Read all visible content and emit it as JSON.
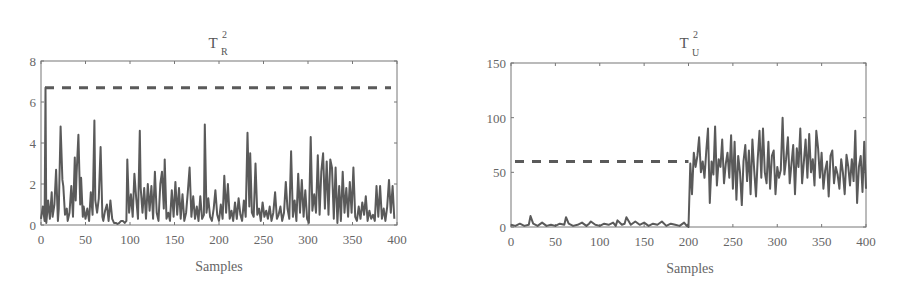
{
  "chart_data": [
    {
      "type": "line",
      "title": "T_R^2",
      "title_base": "T",
      "title_sup": "2",
      "title_sub": "R",
      "xlabel": "Samples",
      "ylabel": "",
      "xlim": [
        0,
        400
      ],
      "ylim": [
        0,
        8
      ],
      "xticks": [
        0,
        50,
        100,
        150,
        200,
        250,
        300,
        350,
        400
      ],
      "yticks": [
        0,
        2,
        4,
        6,
        8
      ],
      "grid": false,
      "threshold": {
        "name": "control limit",
        "style": "dashed",
        "value": 6.7
      },
      "series": [
        {
          "name": "T_R^2 statistic",
          "style": "solid",
          "x": [
            0,
            2,
            4,
            5,
            6,
            7,
            8,
            10,
            12,
            13,
            15,
            17,
            19,
            20,
            22,
            24,
            25,
            27,
            29,
            30,
            32,
            34,
            36,
            38,
            39,
            40,
            42,
            44,
            45,
            47,
            48,
            50,
            52,
            54,
            56,
            58,
            60,
            61,
            63,
            65,
            67,
            69,
            70,
            72,
            74,
            76,
            78,
            80,
            82,
            84,
            86,
            88,
            90,
            92,
            94,
            96,
            97,
            99,
            101,
            103,
            105,
            107,
            109,
            111,
            112,
            114,
            116,
            118,
            120,
            122,
            124,
            126,
            128,
            130,
            132,
            134,
            136,
            138,
            139,
            141,
            143,
            145,
            147,
            149,
            151,
            153,
            155,
            157,
            159,
            161,
            163,
            165,
            167,
            169,
            171,
            173,
            175,
            177,
            179,
            181,
            183,
            184,
            186,
            188,
            190,
            192,
            194,
            196,
            198,
            200,
            202,
            204,
            206,
            208,
            210,
            212,
            214,
            216,
            218,
            220,
            222,
            224,
            226,
            228,
            230,
            232,
            234,
            235,
            237,
            239,
            241,
            243,
            245,
            247,
            249,
            251,
            253,
            255,
            257,
            259,
            261,
            263,
            265,
            267,
            269,
            271,
            273,
            275,
            277,
            279,
            281,
            283,
            285,
            287,
            289,
            291,
            293,
            295,
            297,
            299,
            301,
            303,
            305,
            307,
            309,
            311,
            313,
            315,
            317,
            319,
            321,
            323,
            325,
            327,
            329,
            331,
            333,
            335,
            337,
            339,
            341,
            343,
            345,
            347,
            349,
            351,
            353,
            355,
            357,
            359,
            361,
            363,
            365,
            367,
            369,
            371,
            373,
            375,
            377,
            379,
            381,
            383,
            385,
            387,
            389,
            391,
            393,
            395,
            397,
            399,
            400
          ],
          "y": [
            0.3,
            0.9,
            0.2,
            6.7,
            0.1,
            0.6,
            1.2,
            0.3,
            1.6,
            0.4,
            1.0,
            2.7,
            0.2,
            0.8,
            4.8,
            2.2,
            1.9,
            0.5,
            0.8,
            0.2,
            0.6,
            1.9,
            0.4,
            3.3,
            1.2,
            2.5,
            4.4,
            1.0,
            2.3,
            0.4,
            0.9,
            0.3,
            0.8,
            0.2,
            1.6,
            0.5,
            5.1,
            1.2,
            0.6,
            1.3,
            3.8,
            0.4,
            0.2,
            0.7,
            1.0,
            0.2,
            1.2,
            0.3,
            0.1,
            0.1,
            0.05,
            0.1,
            0.2,
            0.2,
            0.1,
            0.2,
            3.2,
            0.6,
            1.5,
            0.4,
            2.5,
            1.3,
            0.3,
            4.6,
            1.8,
            0.6,
            1.8,
            0.3,
            2.0,
            0.7,
            1.9,
            0.3,
            2.6,
            0.6,
            0.2,
            2.0,
            2.6,
            0.8,
            3.2,
            0.3,
            0.6,
            0.2,
            1.7,
            0.4,
            2.1,
            0.5,
            1.8,
            0.3,
            1.5,
            0.2,
            0.6,
            1.6,
            2.8,
            0.4,
            1.4,
            0.3,
            0.9,
            0.2,
            1.4,
            0.3,
            0.5,
            4.9,
            0.6,
            1.3,
            0.4,
            0.2,
            0.8,
            1.7,
            0.5,
            0.2,
            1.0,
            0.3,
            2.4,
            0.6,
            2.0,
            0.3,
            0.7,
            0.2,
            1.1,
            0.3,
            1.3,
            0.5,
            0.2,
            1.2,
            0.4,
            4.5,
            0.9,
            3.5,
            0.6,
            0.4,
            3.0,
            0.5,
            0.8,
            0.2,
            1.1,
            0.4,
            0.7,
            0.3,
            0.9,
            0.2,
            0.6,
            1.6,
            0.3,
            0.5,
            0.9,
            0.2,
            0.6,
            2.1,
            0.8,
            0.3,
            3.6,
            0.4,
            1.2,
            0.2,
            2.5,
            0.6,
            2.2,
            0.4,
            1.7,
            0.3,
            0.1,
            4.3,
            0.7,
            1.5,
            0.6,
            3.4,
            0.5,
            2.6,
            3.5,
            0.8,
            3.1,
            0.5,
            3.2,
            2.8,
            0.3,
            2.8,
            0.1,
            1.9,
            0.2,
            2.6,
            0.6,
            1.8,
            0.4,
            2.1,
            0.6,
            2.8,
            0.4,
            0.2,
            0.9,
            0.3,
            1.1,
            0.5,
            1.4,
            0.2,
            0.7,
            0.3,
            0.5,
            0.2,
            1.9,
            0.4,
            1.9,
            0.3,
            0.8,
            0.2,
            0.9,
            2.2,
            0.6,
            1.9,
            0.3
          ]
        }
      ]
    },
    {
      "type": "line",
      "title": "T_U^2",
      "title_base": "T",
      "title_sup": "2",
      "title_sub": "U",
      "xlabel": "Samples",
      "ylabel": "",
      "xlim": [
        0,
        400
      ],
      "ylim": [
        0,
        150
      ],
      "xticks": [
        0,
        50,
        100,
        150,
        200,
        250,
        300,
        350,
        400
      ],
      "yticks": [
        0,
        50,
        100,
        150
      ],
      "grid": false,
      "threshold": {
        "name": "control limit",
        "style": "dashed",
        "value": 60
      },
      "series": [
        {
          "name": "T_U^2 statistic",
          "style": "solid",
          "x": [
            0,
            5,
            10,
            15,
            20,
            22,
            25,
            30,
            35,
            40,
            45,
            50,
            55,
            60,
            62,
            65,
            70,
            75,
            80,
            85,
            88,
            90,
            95,
            100,
            105,
            110,
            115,
            118,
            120,
            125,
            128,
            130,
            135,
            140,
            145,
            150,
            155,
            160,
            165,
            170,
            175,
            180,
            185,
            190,
            195,
            198,
            199,
            200,
            202,
            204,
            206,
            208,
            210,
            212,
            214,
            216,
            218,
            220,
            222,
            224,
            226,
            228,
            230,
            232,
            234,
            236,
            238,
            240,
            242,
            244,
            246,
            248,
            250,
            252,
            254,
            256,
            258,
            260,
            262,
            264,
            266,
            268,
            270,
            272,
            274,
            276,
            278,
            280,
            282,
            284,
            286,
            288,
            290,
            292,
            294,
            296,
            298,
            300,
            302,
            304,
            306,
            308,
            310,
            312,
            314,
            316,
            318,
            320,
            322,
            324,
            326,
            328,
            330,
            332,
            334,
            336,
            338,
            340,
            342,
            344,
            346,
            348,
            350,
            352,
            354,
            356,
            358,
            360,
            362,
            364,
            366,
            368,
            370,
            372,
            374,
            376,
            378,
            380,
            382,
            384,
            386,
            388,
            390,
            392,
            394,
            396,
            398,
            400
          ],
          "y": [
            2,
            1,
            3,
            1,
            2,
            10,
            3,
            1,
            4,
            1,
            2,
            1,
            3,
            2,
            9,
            3,
            1,
            2,
            4,
            1,
            3,
            5,
            2,
            1,
            3,
            2,
            4,
            1,
            6,
            2,
            3,
            9,
            2,
            5,
            2,
            4,
            1,
            3,
            2,
            5,
            1,
            3,
            2,
            1,
            4,
            1,
            2,
            0,
            58,
            30,
            68,
            55,
            65,
            82,
            50,
            60,
            45,
            70,
            90,
            22,
            60,
            48,
            92,
            38,
            62,
            55,
            80,
            40,
            58,
            68,
            45,
            84,
            35,
            78,
            25,
            65,
            50,
            20,
            60,
            75,
            42,
            70,
            30,
            80,
            52,
            28,
            62,
            88,
            45,
            90,
            50,
            40,
            78,
            35,
            65,
            70,
            30,
            55,
            45,
            52,
            100,
            48,
            62,
            82,
            40,
            58,
            75,
            30,
            72,
            55,
            90,
            40,
            60,
            80,
            45,
            85,
            50,
            62,
            38,
            88,
            72,
            45,
            68,
            35,
            52,
            60,
            28,
            65,
            70,
            40,
            55,
            48,
            35,
            62,
            50,
            30,
            66,
            55,
            38,
            62,
            42,
            88,
            22,
            55,
            65,
            32,
            78,
            35,
            95
          ]
        }
      ]
    }
  ]
}
